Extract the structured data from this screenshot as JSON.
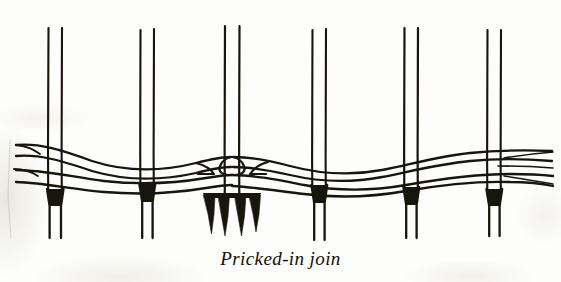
{
  "figure": {
    "title": "Pricked-in join",
    "caption": "Pricked-in join",
    "medium": "scanned line drawing",
    "ink_color": "#151311",
    "paper_color": "#fdfdfb",
    "canvas": {
      "width": 561,
      "height": 282
    },
    "warp": {
      "count_pairs": 6,
      "label": "warp thread pairs",
      "top_y": 28,
      "bottom_y": 238,
      "pair_gap": 13,
      "thread_width": 2,
      "pair_center_x": [
        55,
        147,
        232,
        319,
        411,
        494
      ]
    },
    "weft": {
      "count_lines": 4,
      "label": "weft thread bands",
      "left_edge_x": 14,
      "right_edge_x": 552,
      "baseline_y": [
        146,
        157,
        172,
        184
      ]
    },
    "join": {
      "label": "pricked-in join",
      "center_x": 232,
      "tail_count": 4,
      "tail_top_y": 196,
      "tail_bottom_y": 234,
      "tail_x": [
        211,
        224,
        240,
        252
      ]
    },
    "warp_tails": {
      "label": "warp tail wedges below weft",
      "wedge_top_y": 190,
      "wedge_bottom_y": 206,
      "columns_x": [
        55,
        147,
        319,
        411,
        494
      ]
    }
  }
}
